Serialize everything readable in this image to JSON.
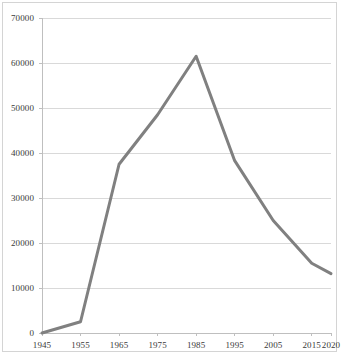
{
  "figure": {
    "border_color": "#d4d4d4",
    "background": "#ffffff"
  },
  "chart_data": {
    "type": "line",
    "title": "",
    "subtitle": "",
    "xlabel": "",
    "ylabel": "",
    "legend": [],
    "legend_position": "none",
    "grid": true,
    "grid_axis": "y",
    "grid_color": "#d9d9d9",
    "axis_color": "#bfbfbf",
    "line_color": "#808080",
    "line_width": 3,
    "markers": false,
    "categories": [
      "1945",
      "1955",
      "1965",
      "1975",
      "1985",
      "1995",
      "2005",
      "2015",
      "2020"
    ],
    "x": [
      1945,
      1955,
      1965,
      1975,
      1985,
      1995,
      2005,
      2015,
      2020
    ],
    "values": [
      0,
      2500,
      37500,
      48500,
      61500,
      38300,
      25000,
      15500,
      13200
    ],
    "series": [
      {
        "name": "",
        "values": [
          0,
          2500,
          37500,
          48500,
          61500,
          38300,
          25000,
          15500,
          13200
        ]
      }
    ],
    "xlim": [
      1945,
      2020
    ],
    "ylim": [
      0,
      70000
    ],
    "ytick_labels": [
      "0",
      "10000",
      "20000",
      "30000",
      "40000",
      "50000",
      "60000",
      "70000"
    ],
    "ytick_values": [
      0,
      10000,
      20000,
      30000,
      40000,
      50000,
      60000,
      70000
    ],
    "xtick_labels": [
      "1945",
      "1955",
      "1965",
      "1975",
      "1985",
      "1995",
      "2005",
      "2015",
      "2020"
    ],
    "xtick_values": [
      1945,
      1955,
      1965,
      1975,
      1985,
      1995,
      2005,
      2015,
      2020
    ]
  }
}
